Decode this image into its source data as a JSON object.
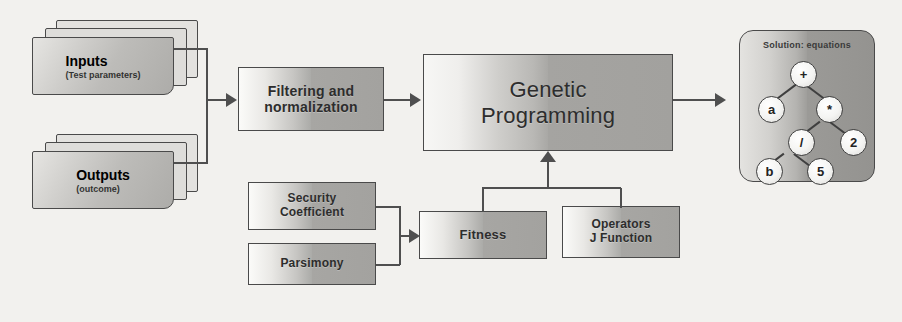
{
  "diagram": {
    "background_color": "#f2f1ee",
    "line_color": "#4f4f4f"
  },
  "inputs": {
    "label": "Inputs",
    "sublabel": "(Test parameters)"
  },
  "outputs": {
    "label": "Outputs",
    "sublabel": "(outcome)"
  },
  "filtering": {
    "line1": "Filtering and",
    "line2": "normalization"
  },
  "genetic_programming": {
    "line1": "Genetic",
    "line2": "Programming"
  },
  "security_coefficient": {
    "line1": "Security",
    "line2": "Coefficient"
  },
  "parsimony": {
    "label": "Parsimony"
  },
  "fitness": {
    "label": "Fitness"
  },
  "operators": {
    "line1": "Operators",
    "line2": "J Function"
  },
  "solution": {
    "title": "Solution: equations",
    "tree_nodes": [
      {
        "id": "root",
        "label": "+"
      },
      {
        "id": "left1",
        "label": "a"
      },
      {
        "id": "right1",
        "label": "*"
      },
      {
        "id": "div",
        "label": "/"
      },
      {
        "id": "two",
        "label": "2"
      },
      {
        "id": "b",
        "label": "b"
      },
      {
        "id": "five",
        "label": "5"
      }
    ]
  }
}
